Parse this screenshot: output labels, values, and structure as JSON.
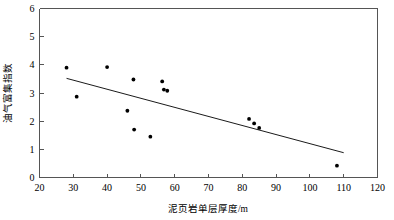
{
  "chart_data": {
    "type": "scatter",
    "title": "",
    "xlabel": "泥页岩单层厚度/m",
    "ylabel": "油气富集指数",
    "xlim": [
      20,
      120
    ],
    "ylim": [
      0,
      6
    ],
    "xticks": [
      20,
      30,
      40,
      50,
      60,
      70,
      80,
      90,
      100,
      110,
      120
    ],
    "yticks": [
      0,
      1,
      2,
      3,
      4,
      5,
      6
    ],
    "grid": false,
    "legend": null,
    "marker": "filled-circle",
    "marker_color": "#000000",
    "points": [
      {
        "x": 28.0,
        "y": 3.9
      },
      {
        "x": 31.0,
        "y": 2.87
      },
      {
        "x": 40.0,
        "y": 3.92
      },
      {
        "x": 46.0,
        "y": 2.37
      },
      {
        "x": 47.8,
        "y": 3.48
      },
      {
        "x": 48.0,
        "y": 1.7
      },
      {
        "x": 52.8,
        "y": 1.45
      },
      {
        "x": 56.3,
        "y": 3.41
      },
      {
        "x": 56.8,
        "y": 3.12
      },
      {
        "x": 57.8,
        "y": 3.08
      },
      {
        "x": 82.0,
        "y": 2.08
      },
      {
        "x": 83.5,
        "y": 1.92
      },
      {
        "x": 85.0,
        "y": 1.76
      },
      {
        "x": 108.0,
        "y": 0.42
      }
    ],
    "trend_line": {
      "x_start": 28.0,
      "y_start": 3.52,
      "x_end": 110.0,
      "y_end": 0.88,
      "color": "#000000"
    },
    "axis_color": "#555555",
    "background": "#ffffff"
  }
}
